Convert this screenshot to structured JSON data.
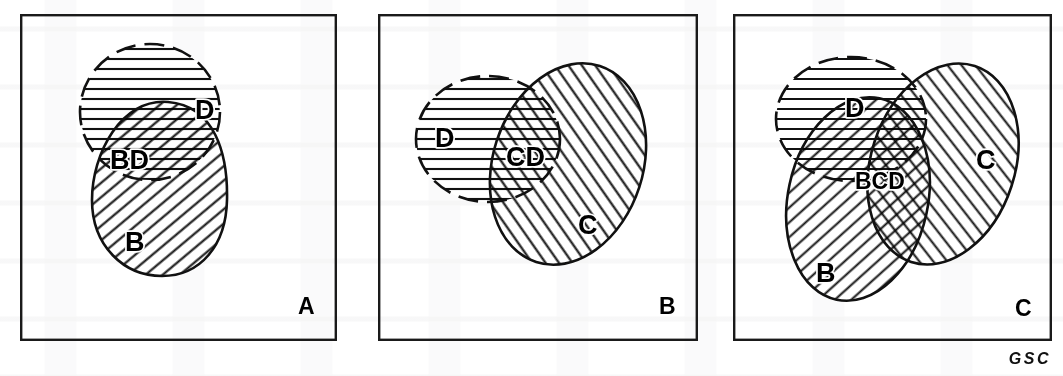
{
  "figure": {
    "caption_credit": "GSC",
    "panels": [
      {
        "id": "A",
        "letter": "A",
        "sets": [
          {
            "key": "D",
            "label": "D",
            "hatch": "horizontal",
            "outline": "dashed"
          },
          {
            "key": "B",
            "label": "B",
            "hatch": "diagonal-up",
            "outline": "solid"
          }
        ],
        "regions": [
          {
            "key": "BD",
            "label": "BD",
            "hatch": "cross-horizontal-diagonal"
          }
        ]
      },
      {
        "id": "B",
        "letter": "B",
        "sets": [
          {
            "key": "D",
            "label": "D",
            "hatch": "horizontal",
            "outline": "dashed"
          },
          {
            "key": "C",
            "label": "C",
            "hatch": "diagonal-down",
            "outline": "solid"
          }
        ],
        "regions": [
          {
            "key": "CD",
            "label": "CD",
            "hatch": "cross-horizontal-diagonal"
          }
        ]
      },
      {
        "id": "C",
        "letter": "C",
        "sets": [
          {
            "key": "D",
            "label": "D",
            "hatch": "horizontal",
            "outline": "dashed"
          },
          {
            "key": "B",
            "label": "B",
            "hatch": "diagonal-up",
            "outline": "solid"
          },
          {
            "key": "C",
            "label": "C",
            "hatch": "diagonal-down",
            "outline": "solid"
          }
        ],
        "regions": [
          {
            "key": "BCD",
            "label": "BCD",
            "hatch": "dense-cross"
          }
        ]
      }
    ]
  },
  "colors": {
    "ink": "#111111",
    "frame": "#1a1a1a",
    "paper": "#ffffff"
  },
  "labels": {
    "a_D": "D",
    "a_BD": "BD",
    "a_B": "B",
    "a_panel": "A",
    "b_D": "D",
    "b_CD": "CD",
    "b_C": "C",
    "b_panel": "B",
    "c_D": "D",
    "c_BCD": "BCD",
    "c_B": "B",
    "c_C": "C",
    "c_panel": "C",
    "credit": "GSC"
  }
}
